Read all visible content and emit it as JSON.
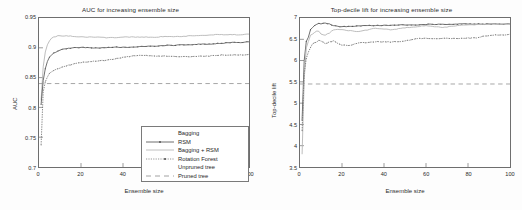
{
  "figure": {
    "background_color": "#fdfdfd",
    "axes_color": "#6e6e6e",
    "text_color": "#2b2b2b"
  },
  "panels": [
    {
      "id": "auc-panel",
      "title": "AUC for increasing ensemble size",
      "xlabel": "Ensemble size",
      "ylabel": "AUC",
      "xticks": [
        "0",
        "20",
        "40",
        "60",
        "80",
        "100"
      ],
      "yticks": [
        "0.7",
        "0.75",
        "0.8",
        "0.85",
        "0.9",
        "0.95"
      ]
    },
    {
      "id": "lift-panel",
      "title": "Top-decile lift for increasing ensemble size",
      "xlabel": "Ensemble size",
      "ylabel": "Top-decile lift",
      "xticks": [
        "0",
        "20",
        "40",
        "60",
        "80",
        "100"
      ],
      "yticks": [
        "3.5",
        "4",
        "4.5",
        "5",
        "5.5",
        "6",
        "6.5",
        "7"
      ]
    }
  ],
  "legend": {
    "items": [
      {
        "label": "Bagging",
        "style": "solid-thin",
        "color": "#8e8e8e"
      },
      {
        "label": "RSM",
        "style": "solid-marker",
        "color": "#4a4a4a"
      },
      {
        "label": "Bagging + RSM",
        "style": "solid-light",
        "color": "#a6a6a6"
      },
      {
        "label": "Rotation Forest",
        "style": "dot-marker",
        "color": "#5a5a5a"
      },
      {
        "label": "Unpruned tree",
        "style": "none",
        "color": "#9a9a9a"
      },
      {
        "label": "Pruned tree",
        "style": "dashed",
        "color": "#8a8a8a"
      }
    ]
  },
  "chart_data": [
    {
      "type": "line",
      "id": "auc-panel",
      "title": "AUC for increasing ensemble size",
      "xlabel": "Ensemble size",
      "ylabel": "AUC",
      "xlim": [
        0,
        100
      ],
      "ylim": [
        0.7,
        0.95
      ],
      "grid": false,
      "legend_position": "lower right",
      "x": [
        1,
        2,
        3,
        4,
        5,
        6,
        7,
        8,
        9,
        10,
        12,
        14,
        16,
        18,
        20,
        24,
        28,
        32,
        36,
        40,
        44,
        48,
        52,
        56,
        60,
        64,
        68,
        72,
        76,
        80,
        84,
        88,
        92,
        96,
        100
      ],
      "series": [
        {
          "name": "Bagging + RSM",
          "values": [
            0.812,
            0.868,
            0.893,
            0.905,
            0.912,
            0.916,
            0.918,
            0.919,
            0.92,
            0.92,
            0.92,
            0.92,
            0.919,
            0.919,
            0.918,
            0.918,
            0.918,
            0.917,
            0.917,
            0.918,
            0.918,
            0.918,
            0.918,
            0.918,
            0.919,
            0.919,
            0.919,
            0.92,
            0.92,
            0.921,
            0.922,
            0.922,
            0.922,
            0.922,
            0.923
          ]
        },
        {
          "name": "RSM",
          "values": [
            0.805,
            0.845,
            0.865,
            0.877,
            0.884,
            0.888,
            0.891,
            0.893,
            0.895,
            0.896,
            0.898,
            0.899,
            0.9,
            0.9,
            0.901,
            0.9,
            0.9,
            0.9,
            0.901,
            0.901,
            0.901,
            0.902,
            0.903,
            0.903,
            0.904,
            0.904,
            0.905,
            0.905,
            0.906,
            0.906,
            0.907,
            0.908,
            0.909,
            0.909,
            0.91
          ]
        },
        {
          "name": "Rotation Forest",
          "values": [
            0.737,
            0.826,
            0.843,
            0.851,
            0.857,
            0.86,
            0.862,
            0.864,
            0.865,
            0.866,
            0.869,
            0.871,
            0.872,
            0.874,
            0.875,
            0.877,
            0.878,
            0.879,
            0.881,
            0.884,
            0.886,
            0.887,
            0.887,
            0.886,
            0.886,
            0.886,
            0.885,
            0.885,
            0.886,
            0.886,
            0.887,
            0.888,
            0.888,
            0.888,
            0.889
          ]
        },
        {
          "name": "Pruned tree",
          "constant": 0.84,
          "style": "dashed"
        }
      ]
    },
    {
      "type": "line",
      "id": "lift-panel",
      "title": "Top-decile lift for increasing ensemble size",
      "xlabel": "Ensemble size",
      "ylabel": "Top-decile lift",
      "xlim": [
        0,
        100
      ],
      "ylim": [
        3.5,
        7.0
      ],
      "grid": false,
      "legend_position": "lower right",
      "x": [
        1,
        2,
        3,
        4,
        5,
        6,
        7,
        8,
        9,
        10,
        12,
        14,
        16,
        18,
        20,
        24,
        28,
        32,
        36,
        40,
        44,
        48,
        52,
        56,
        60,
        64,
        68,
        72,
        76,
        80,
        84,
        88,
        92,
        96,
        100
      ],
      "series": [
        {
          "name": "RSM",
          "values": [
            4.6,
            6.0,
            6.45,
            6.55,
            6.72,
            6.78,
            6.82,
            6.86,
            6.88,
            6.86,
            6.88,
            6.86,
            6.82,
            6.8,
            6.8,
            6.8,
            6.82,
            6.82,
            6.82,
            6.83,
            6.83,
            6.84,
            6.84,
            6.84,
            6.85,
            6.85,
            6.85,
            6.85,
            6.86,
            6.86,
            6.86,
            6.86,
            6.86,
            6.86,
            6.86
          ]
        },
        {
          "name": "Bagging + RSM",
          "values": [
            3.8,
            5.55,
            6.3,
            6.45,
            6.6,
            6.62,
            6.66,
            6.7,
            6.68,
            6.62,
            6.6,
            6.65,
            6.72,
            6.74,
            6.72,
            6.7,
            6.68,
            6.72,
            6.76,
            6.74,
            6.72,
            6.76,
            6.78,
            6.8,
            6.82,
            6.8,
            6.78,
            6.8,
            6.82,
            6.84,
            6.84,
            6.85,
            6.86,
            6.86,
            6.86
          ]
        },
        {
          "name": "Rotation Forest",
          "values": [
            4.35,
            5.7,
            6.05,
            6.2,
            6.3,
            6.4,
            6.42,
            6.44,
            6.48,
            6.46,
            6.4,
            6.44,
            6.46,
            6.4,
            6.36,
            6.36,
            6.42,
            6.42,
            6.44,
            6.44,
            6.44,
            6.44,
            6.48,
            6.52,
            6.52,
            6.52,
            6.52,
            6.52,
            6.52,
            6.53,
            6.53,
            6.58,
            6.6,
            6.6,
            6.62
          ]
        },
        {
          "name": "Pruned tree",
          "constant": 5.45,
          "style": "dashed"
        }
      ]
    }
  ]
}
